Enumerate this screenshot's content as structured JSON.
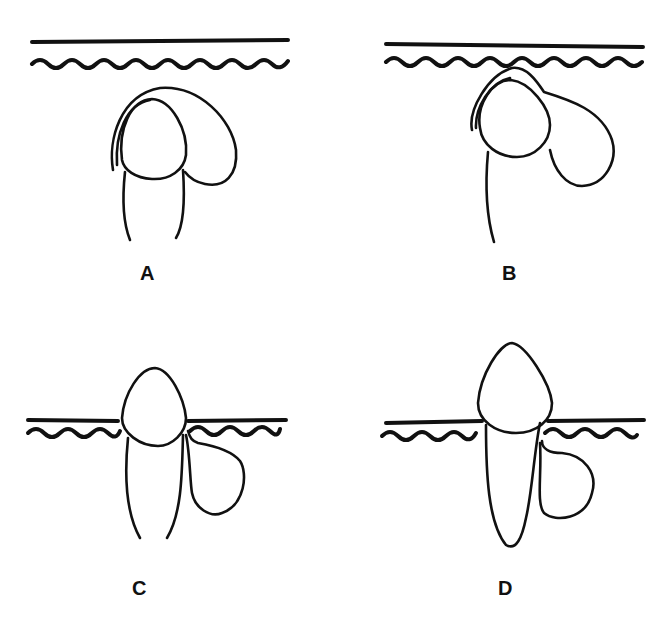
{
  "figure": {
    "panels": [
      {
        "id": "A",
        "label": "A",
        "description": "Tooth crown beneath gingiva with follicle sac enclosing crown"
      },
      {
        "id": "B",
        "label": "B",
        "description": "Crown approaching gingiva with follicle sac expanding distally"
      },
      {
        "id": "C",
        "label": "C",
        "description": "Crown erupted through gingiva with cyst sac at cervical side"
      },
      {
        "id": "D",
        "label": "D",
        "description": "Fully erupted tooth with root and cystic sac alongside root"
      }
    ],
    "colors": {
      "line": "#111111",
      "background": "#ffffff"
    }
  }
}
